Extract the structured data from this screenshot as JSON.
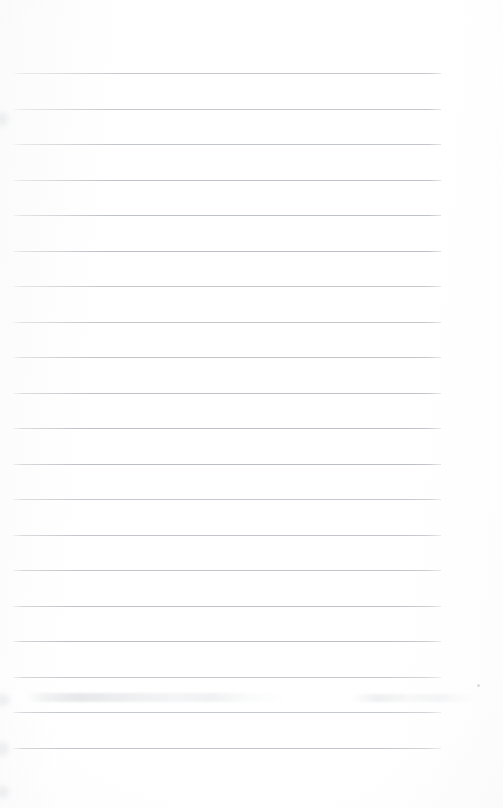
{
  "page": {
    "kind": "scanned-lined-notepad-page",
    "width_px": 503,
    "height_px": 808,
    "background_color": "#ffffff",
    "caption": "Blank scanned page of ruled notepad paper",
    "written_text": "",
    "has_visible_text": false
  },
  "ruling": {
    "line_color": "#b9bcc0",
    "line_thickness_px": 1,
    "line_count": 20,
    "line_left_x": 13,
    "line_right_x": 441,
    "line_width_px": 428,
    "first_line_y": 73,
    "spacing_px": 35.5,
    "top_margin_px": 73,
    "bottom_margin_px": 60,
    "line_y_positions": [
      73,
      108.5,
      144,
      179.5,
      215,
      250.5,
      286,
      321.5,
      357,
      392.5,
      428,
      463.5,
      499,
      534.5,
      570,
      605.5,
      641,
      676.5,
      712,
      747.5
    ]
  },
  "artifacts": {
    "smudge_band": {
      "name": "bleed-through-smudge",
      "x": 26,
      "y": 693,
      "width": 300,
      "height": 9,
      "color": "#cdd0d4"
    },
    "smudge_band_right": {
      "name": "bleed-through-smudge-right",
      "x": 352,
      "y": 694,
      "width": 125,
      "height": 8,
      "color": "#d2d4d8"
    },
    "dust_speck": {
      "name": "dust-speck",
      "x": 477,
      "y": 684,
      "color": "#aaadb2"
    },
    "edge_blotches": [
      {
        "x": -6,
        "y": 694,
        "width": 16,
        "height": 12
      },
      {
        "x": -5,
        "y": 742,
        "width": 14,
        "height": 14
      },
      {
        "x": -4,
        "y": 786,
        "width": 13,
        "height": 12
      },
      {
        "x": -5,
        "y": 112,
        "width": 13,
        "height": 14
      }
    ]
  }
}
